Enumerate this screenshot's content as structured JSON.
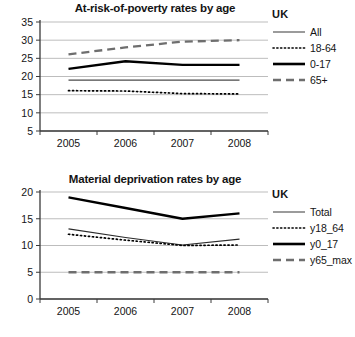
{
  "charts": [
    {
      "id": "at-risk-of-poverty",
      "title": "At-risk-of-poverty rates by age",
      "legend_title": "UK",
      "x_labels": [
        "2005",
        "2006",
        "2007",
        "2008"
      ],
      "y_ticks": [
        "5",
        "10",
        "15",
        "20",
        "25",
        "30",
        "35"
      ],
      "series_labels": [
        "All",
        "18-64",
        "0-17",
        "65+"
      ]
    },
    {
      "id": "material-deprivation",
      "title": "Material deprivation rates by age",
      "legend_title": "UK",
      "x_labels": [
        "2005",
        "2006",
        "2007",
        "2008"
      ],
      "y_ticks": [
        "0",
        "5",
        "10",
        "15",
        "20"
      ],
      "series_labels": [
        "Total",
        "y18_64",
        "y0_17",
        "y65_max"
      ]
    }
  ],
  "colors": {
    "line_dark": "#000000",
    "line_gray": "#6e6e6e",
    "gridline": "#b5b5b5",
    "axis": "#3a3a3a",
    "text": "#141414",
    "background": "#ffffff"
  },
  "chart_data": [
    {
      "type": "line",
      "title": "At-risk-of-poverty rates by age",
      "xlabel": "",
      "ylabel": "",
      "x": [
        "2005",
        "2006",
        "2007",
        "2008"
      ],
      "categories": [
        "2005",
        "2006",
        "2007",
        "2008"
      ],
      "ylim": [
        5,
        35
      ],
      "ytick_step": 5,
      "grid": true,
      "legend_position": "right",
      "legend_title": "UK",
      "series": [
        {
          "name": "All",
          "values": [
            19.0,
            19.0,
            19.0,
            19.0
          ],
          "style": "solid-thin",
          "color": "#4a4a4a"
        },
        {
          "name": "18-64",
          "values": [
            16.1,
            16.0,
            15.3,
            15.2
          ],
          "style": "dotted",
          "color": "#000000"
        },
        {
          "name": "0-17",
          "values": [
            22.1,
            24.2,
            23.2,
            23.2
          ],
          "style": "solid-thick",
          "color": "#000000"
        },
        {
          "name": "65+",
          "values": [
            26.1,
            28.0,
            29.6,
            30.0
          ],
          "style": "dashed",
          "color": "#6e6e6e"
        }
      ]
    },
    {
      "type": "line",
      "title": "Material deprivation rates by age",
      "xlabel": "",
      "ylabel": "",
      "x": [
        "2005",
        "2006",
        "2007",
        "2008"
      ],
      "categories": [
        "2005",
        "2006",
        "2007",
        "2008"
      ],
      "ylim": [
        0,
        20
      ],
      "ytick_step": 5,
      "grid": true,
      "legend_position": "right",
      "legend_title": "UK",
      "series": [
        {
          "name": "Total",
          "values": [
            13.1,
            11.5,
            10.1,
            11.2
          ],
          "style": "solid-thin",
          "color": "#2a2a2a"
        },
        {
          "name": "y18_64",
          "values": [
            12.1,
            11.0,
            10.0,
            10.1
          ],
          "style": "dotted",
          "color": "#000000"
        },
        {
          "name": "y0_17",
          "values": [
            19.0,
            17.0,
            15.0,
            16.0
          ],
          "style": "solid-thick",
          "color": "#000000"
        },
        {
          "name": "y65_max",
          "values": [
            5.0,
            5.0,
            5.0,
            5.0
          ],
          "style": "dashed",
          "color": "#6e6e6e"
        }
      ]
    }
  ]
}
